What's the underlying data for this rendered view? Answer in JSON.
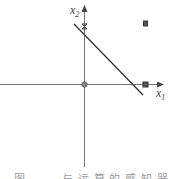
{
  "diagram": {
    "axes": {
      "x_label": "x",
      "x_sub": "1",
      "y_label": "x",
      "y_sub": "2",
      "color": "#555555"
    },
    "points": [
      {
        "name": "origin",
        "marker": "circle",
        "x": 0,
        "y": 0
      },
      {
        "name": "point-on-x2",
        "marker": "cross",
        "x": 0,
        "y": 1
      },
      {
        "name": "point-on-x1",
        "marker": "cross",
        "x": 1,
        "y": 0
      },
      {
        "name": "point-x1-x2",
        "marker": "cross",
        "x": 1,
        "y": 1
      }
    ],
    "decision_line": {
      "from": [
        -0.15,
        1.0
      ],
      "to": [
        0.95,
        -0.18
      ],
      "color": "#333333"
    }
  },
  "caption": {
    "figure_label": "图",
    "text": "与 运 算 的 感 知 器"
  }
}
